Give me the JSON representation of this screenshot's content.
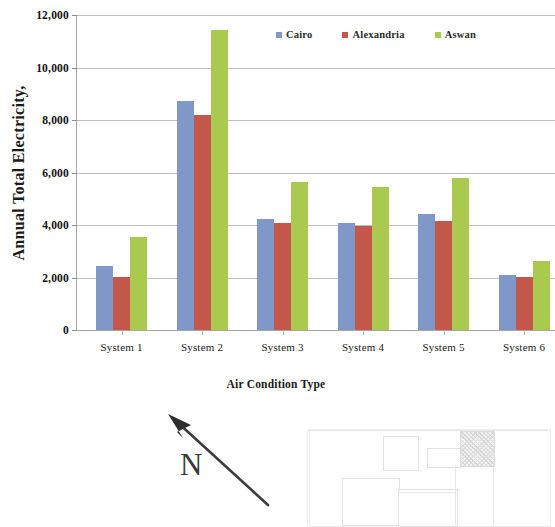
{
  "chart_data": {
    "type": "bar",
    "title": "",
    "xlabel": "Air Condition Type",
    "ylabel": "Annual Total Electricity,",
    "categories": [
      "System 1",
      "System 2",
      "System 3",
      "System 4",
      "System 5",
      "System 6"
    ],
    "series": [
      {
        "name": "Cairo",
        "color": "#8098c8",
        "values": [
          2430,
          8720,
          4230,
          4080,
          4420,
          2110
        ]
      },
      {
        "name": "Alexandria",
        "color": "#c2574a",
        "values": [
          2030,
          8200,
          4060,
          3960,
          4160,
          2020
        ]
      },
      {
        "name": "Aswan",
        "color": "#a9c94f",
        "values": [
          3530,
          11440,
          5640,
          5450,
          5780,
          2620
        ]
      }
    ],
    "ylim": [
      0,
      12000
    ],
    "ytick_values": [
      0,
      2000,
      4000,
      6000,
      8000,
      10000,
      12000
    ],
    "ytick_labels": [
      "0",
      "2,000",
      "4,000",
      "6,000",
      "8,000",
      "10,000",
      "12,000"
    ],
    "grid": true,
    "legend_position": "top-right",
    "note": "System 6 group is clipped at the right edge of the image"
  },
  "annotations": {
    "north_label": "N",
    "north_arrow_direction": "up-left"
  },
  "site_plan": {
    "description": "faint light-gray architectural site plan with rectangular building footprints and one hatched block at upper right"
  }
}
